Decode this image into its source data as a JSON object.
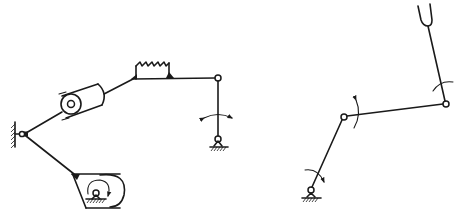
{
  "diagram": {
    "type": "mechanism-kinematic-sketches",
    "colors": {
      "stroke": "#1a1a1a",
      "background": "#ffffff"
    },
    "figures": [
      {
        "id": "left",
        "description": "Linkage with ground pivot, roller/cylinder pair, spring element, rocker and cam",
        "components": [
          "ground-wall-pivot",
          "roller-cylinder",
          "spring-element",
          "rocker-joint",
          "rocker-ground-pivot",
          "rocker-oscillation-arrow",
          "cam-housing",
          "cam-rotation-arrow",
          "cam-ground-pivot"
        ]
      },
      {
        "id": "right",
        "description": "Four-bar style linkage with crank, coupler, rocker and fork end",
        "components": [
          "crank-ground-pivot",
          "crank-rotation-arrow",
          "crank-coupler-joint",
          "joint-rotation-arrow",
          "coupler-rocker-joint",
          "rocker-rotation-arrow",
          "fork-end"
        ]
      }
    ]
  }
}
